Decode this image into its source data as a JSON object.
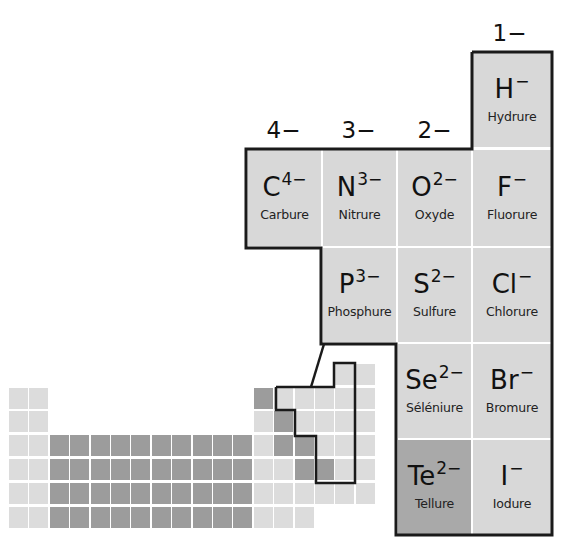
{
  "diagram": {
    "charge_headers": [
      {
        "label": "4−",
        "column": "C"
      },
      {
        "label": "3−",
        "column": "N"
      },
      {
        "label": "2−",
        "column": "O"
      },
      {
        "label": "1−",
        "column": "H/F"
      }
    ],
    "ions": [
      {
        "symbol": "H",
        "charge": "−",
        "name": "Hydrure",
        "shade": "light"
      },
      {
        "symbol": "C",
        "charge": "4−",
        "name": "Carbure",
        "shade": "light"
      },
      {
        "symbol": "N",
        "charge": "3−",
        "name": "Nitrure",
        "shade": "light"
      },
      {
        "symbol": "O",
        "charge": "2−",
        "name": "Oxyde",
        "shade": "light"
      },
      {
        "symbol": "F",
        "charge": "−",
        "name": "Fluorure",
        "shade": "light"
      },
      {
        "symbol": "P",
        "charge": "3−",
        "name": "Phosphure",
        "shade": "light"
      },
      {
        "symbol": "S",
        "charge": "2−",
        "name": "Sulfure",
        "shade": "light"
      },
      {
        "symbol": "Cl",
        "charge": "−",
        "name": "Chlorure",
        "shade": "light"
      },
      {
        "symbol": "Se",
        "charge": "2−",
        "name": "Séléniure",
        "shade": "light"
      },
      {
        "symbol": "Br",
        "charge": "−",
        "name": "Bromure",
        "shade": "light"
      },
      {
        "symbol": "Te",
        "charge": "2−",
        "name": "Tellure",
        "shade": "dark"
      },
      {
        "symbol": "I",
        "charge": "−",
        "name": "Iodure",
        "shade": "light"
      }
    ],
    "colors": {
      "cell_light": "#d8d8d8",
      "cell_dark": "#a9a9a9",
      "mini_light": "#dcdcdc",
      "mini_dark": "#9c9c9c",
      "outline": "#1a1a1a"
    }
  }
}
